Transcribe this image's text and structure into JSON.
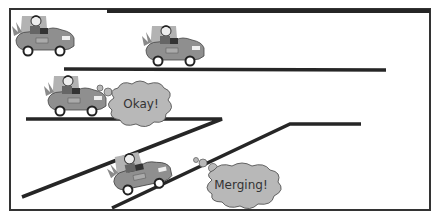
{
  "diagram": {
    "frame": {
      "x": 10,
      "y": 8,
      "width": 420,
      "height": 202,
      "stroke": "#333333"
    },
    "colors": {
      "road_line": "#262626",
      "cloud_fill": "#b8b8b8",
      "cloud_stroke": "#555555",
      "car_body": "#8a8a8a",
      "car_shadow": "#b0b0b0",
      "text": "#333333"
    },
    "roads": [
      {
        "name": "top-lane-edge",
        "points": [
          [
            107,
            11
          ],
          [
            430,
            11
          ]
        ]
      },
      {
        "name": "middle-lane-divider",
        "points": [
          [
            64,
            69
          ],
          [
            386,
            70
          ]
        ]
      },
      {
        "name": "lower-lane-edge",
        "points": [
          [
            22,
            197
          ],
          [
            222,
            119
          ],
          [
            26,
            119
          ]
        ]
      },
      {
        "name": "on-ramp-edge",
        "points": [
          [
            112,
            208
          ],
          [
            290,
            124
          ],
          [
            361,
            124
          ]
        ]
      }
    ],
    "cars": [
      {
        "name": "car-top-left",
        "x": 12,
        "y": 14
      },
      {
        "name": "car-top-middle",
        "x": 142,
        "y": 24
      },
      {
        "name": "car-middle-lane",
        "x": 44,
        "y": 74
      },
      {
        "name": "car-on-ramp",
        "x": 108,
        "y": 150
      }
    ],
    "bubbles": [
      {
        "name": "okay-bubble",
        "text": "Okay!",
        "cx": 141,
        "cy": 104
      },
      {
        "name": "merging-bubble",
        "text": "Merging!",
        "cx": 241,
        "cy": 184
      }
    ]
  }
}
